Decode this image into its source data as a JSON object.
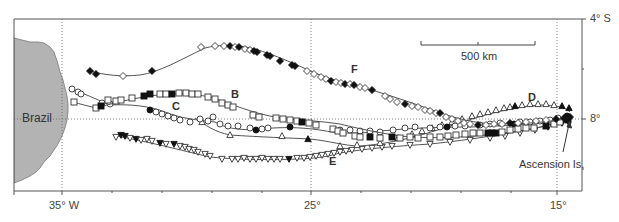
{
  "map": {
    "land_label": "Brazil",
    "island_label": "Ascension Is.",
    "scale_bar_label": "500 km",
    "track_labels": [
      "B",
      "C",
      "D",
      "E",
      "F"
    ],
    "x_axis": {
      "ticks": [
        {
          "label": "35° W",
          "value": -35
        },
        {
          "label": "25°",
          "value": -25
        },
        {
          "label": "15°",
          "value": -15
        }
      ],
      "minor_tick_interval_deg": 2
    },
    "y_axis": {
      "ticks": [
        {
          "label": "4° S",
          "value": -4
        },
        {
          "label": "8°",
          "value": -8
        }
      ],
      "minor_tick_interval_deg": 2
    },
    "gridlines": {
      "longitudes": [
        -35,
        -25,
        -15
      ],
      "latitudes": [
        -8
      ],
      "style": "dotted"
    },
    "colors": {
      "land": "#b3b3b3",
      "track": "#555555",
      "frame": "#555555",
      "marker_filled": "#111111",
      "marker_open": "#ffffff"
    }
  },
  "tracks": [
    {
      "label": "F",
      "marker": "diamond"
    },
    {
      "label": "B",
      "marker": "square"
    },
    {
      "label": "C",
      "marker": "circle"
    },
    {
      "label": "D",
      "marker": "triangle-up"
    },
    {
      "label": "E",
      "marker": "triangle-down"
    }
  ]
}
